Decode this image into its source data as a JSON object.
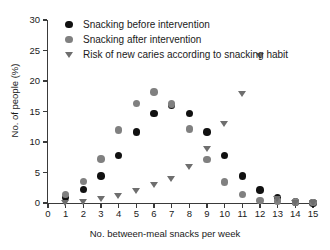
{
  "chart_data": {
    "type": "scatter",
    "title": "",
    "xlabel": "No. between-meal snacks per week",
    "ylabel": "No. of people (%)",
    "xlim": [
      0,
      15
    ],
    "ylim": [
      0,
      30
    ],
    "xticks": [
      0,
      1,
      2,
      3,
      4,
      5,
      6,
      7,
      8,
      9,
      10,
      11,
      12,
      13,
      14,
      15
    ],
    "yticks": [
      0,
      5,
      10,
      15,
      20,
      25,
      30
    ],
    "grid": false,
    "legend_position": "top-left-inside",
    "x": [
      1,
      2,
      3,
      4,
      5,
      6,
      7,
      8,
      9,
      10,
      11,
      12,
      13,
      14,
      15
    ],
    "series": [
      {
        "name": "Snacking before intervention",
        "marker": "circle",
        "color": "#111111",
        "values": [
          0.9,
          2.2,
          4.4,
          7.8,
          11.6,
          14.7,
          16.0,
          14.7,
          11.6,
          7.8,
          4.4,
          2.1,
          0.9,
          0.2,
          0.0
        ]
      },
      {
        "name": "Snacking after intervention",
        "marker": "circle",
        "color": "#808080",
        "values": [
          1.4,
          3.5,
          7.2,
          12.0,
          16.3,
          18.2,
          16.2,
          12.1,
          7.1,
          3.4,
          1.4,
          0.4,
          0.3,
          0.2,
          0.1
        ]
      },
      {
        "name": "Risk of new caries according to snacking habit",
        "marker": "triangle-down",
        "color": "#6e6e6e",
        "values": [
          0.0,
          0.2,
          0.6,
          1.1,
          1.9,
          2.9,
          3.9,
          5.9,
          8.9,
          12.9,
          17.9,
          24.0,
          0.6,
          0.0,
          0.0
        ]
      }
    ],
    "legend": [
      {
        "label": "Snacking before intervention",
        "marker": "circle",
        "color": "#111111"
      },
      {
        "label": "Snacking after intervention",
        "marker": "circle",
        "color": "#808080"
      },
      {
        "label": "Risk of new caries according to snacking habit",
        "marker": "triangle-down",
        "color": "#6e6e6e"
      }
    ],
    "colors": {
      "before": "#111111",
      "after": "#808080",
      "risk": "#6e6e6e",
      "axis": "#3a3a3a",
      "background": "#ffffff",
      "text": "#1a1a1a"
    }
  }
}
